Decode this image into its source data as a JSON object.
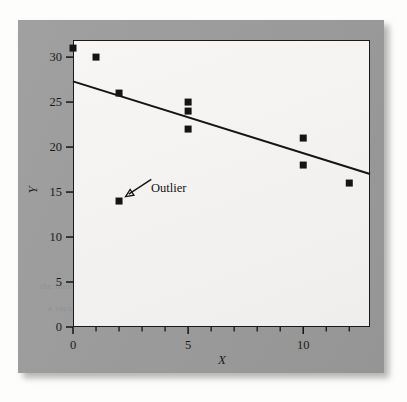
{
  "figure": {
    "background_color": "#fdfdfc",
    "panel_color": "#9b9b9b",
    "plot_background_color": "#f4f3f1",
    "ink_color": "#1a1a1a"
  },
  "ghost": {
    "line1": "the faint offset text showing through the page",
    "line2": "a second faded line of background print"
  },
  "chart_data": {
    "type": "scatter",
    "title": "",
    "xlabel": "X",
    "ylabel": "Y",
    "xlim": [
      0,
      12.9
    ],
    "ylim": [
      0,
      31.9
    ],
    "grid": false,
    "legend": null,
    "xticks": [
      0,
      5,
      10
    ],
    "xtick_labels": [
      "0",
      "5",
      "10"
    ],
    "xminor_ticks": [
      1,
      2,
      3,
      4,
      6,
      7,
      8,
      9,
      11,
      12
    ],
    "yticks": [
      0,
      5,
      10,
      15,
      20,
      25,
      30
    ],
    "ytick_labels": [
      "0",
      "5",
      "10",
      "15",
      "20",
      "25",
      "30"
    ],
    "points": [
      {
        "x": 0,
        "y": 31
      },
      {
        "x": 1,
        "y": 30
      },
      {
        "x": 2,
        "y": 26
      },
      {
        "x": 2,
        "y": 14
      },
      {
        "x": 5,
        "y": 25
      },
      {
        "x": 5,
        "y": 24
      },
      {
        "x": 5,
        "y": 22
      },
      {
        "x": 10,
        "y": 21
      },
      {
        "x": 10,
        "y": 18
      },
      {
        "x": 12,
        "y": 16
      }
    ],
    "marker": {
      "shape": "square",
      "size": 7,
      "color": "#141414"
    },
    "fit_line": {
      "label": "regression line",
      "x_start": 0,
      "y_start": 27.3,
      "x_end": 12.9,
      "y_end": 17.0,
      "color": "#141414",
      "width": 2
    },
    "annotations": [
      {
        "text": "Outlier",
        "target_x": 2,
        "target_y": 14,
        "label_x": 3.4,
        "label_y": 16.4,
        "arrow": true
      }
    ]
  }
}
